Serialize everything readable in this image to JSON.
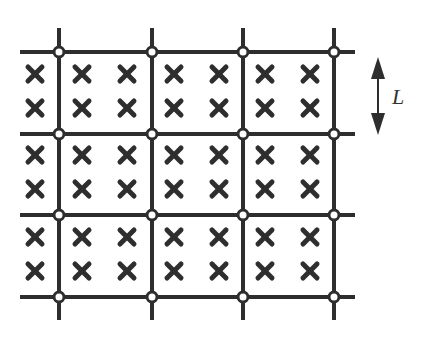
{
  "diagram": {
    "type": "lattice-grid",
    "colors": {
      "line": "#2e2e2e",
      "cross": "#2e2e2e",
      "node_fill": "#ffffff",
      "arrow": "#2e2e2e"
    },
    "grid": {
      "vertical_lines_x": [
        59,
        152,
        243,
        334
      ],
      "vertical_extent": [
        28,
        320
      ],
      "horizontal_lines_y": [
        52,
        134,
        215,
        297
      ],
      "horizontal_extent": [
        20,
        355
      ],
      "line_width": 4,
      "node_radius": 5
    },
    "crosses": {
      "columns_x": [
        35,
        82,
        127,
        174,
        219,
        265,
        310
      ],
      "rows_y": [
        74,
        108,
        155,
        189,
        237,
        271
      ],
      "size": 7,
      "count": 42
    },
    "dimension_arrow": {
      "x": 378,
      "y_top": 57,
      "y_bottom": 135,
      "label": "L",
      "label_x": 392,
      "label_y": 104
    }
  }
}
